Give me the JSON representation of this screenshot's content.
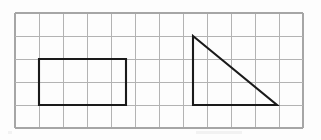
{
  "canvas": {
    "width": 321,
    "height": 140,
    "background_color": "#ffffff",
    "description": "Geometry worksheet figure: a rectangle and a right triangle drawn on a light square grid"
  },
  "grid": {
    "line_color": "#b3b3b3",
    "border_color": "#a6a6a6",
    "cell_size": 23,
    "origin_x": 15,
    "origin_y": 13,
    "columns": 12,
    "rows": 5,
    "vertical_line_x": [
      15,
      39,
      63,
      87,
      111,
      135,
      159,
      183,
      207,
      231,
      255,
      279,
      303
    ],
    "horizontal_line_y": [
      13,
      36,
      59,
      82,
      105,
      128
    ]
  },
  "shapes": [
    {
      "name": "rectangle",
      "label": "rectangle",
      "stroke_color": "#1a1a1a",
      "stroke_width": 2.1,
      "fill": "none",
      "x": 39,
      "y": 59,
      "width": 87,
      "height": 46,
      "width_cells": 3.7,
      "height_cells": 2,
      "points": "39,59 126,59 126,105 39,105"
    },
    {
      "name": "right-triangle",
      "label": "right triangle",
      "stroke_color": "#1a1a1a",
      "stroke_width": 2.1,
      "fill": "none",
      "right_angle_vertex": "bottom-left",
      "vertices": [
        {
          "name": "apex",
          "x": 193,
          "y": 36
        },
        {
          "name": "bottom-right",
          "x": 277,
          "y": 105
        },
        {
          "name": "bottom-left",
          "x": 193,
          "y": 105
        }
      ],
      "points": "193,36 277,105 193,105",
      "base_cells": 3.6,
      "height_cells": 3
    }
  ],
  "artifacts": {
    "scan_smudge_color": "#f2f2f2"
  }
}
